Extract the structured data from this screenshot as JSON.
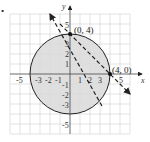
{
  "figure": {
    "bullet": "•",
    "axes": {
      "x_label": "x",
      "y_label": "y",
      "x_ticks": [
        "-5",
        "-3",
        "-2",
        "-1",
        "1",
        "2",
        "3",
        "5"
      ],
      "y_ticks": [
        "5",
        "3",
        "2",
        "1",
        "-1",
        "-2",
        "-3",
        "-5"
      ]
    },
    "points": [
      {
        "label": "(0, 4)",
        "x": 0,
        "y": 4
      },
      {
        "label": "(4, 0)",
        "x": 4,
        "y": 0
      }
    ],
    "circle": {
      "center": [
        0,
        0
      ],
      "radius": 4,
      "shaded": true,
      "style": "solid"
    },
    "line": {
      "through": [
        [
          0,
          4
        ],
        [
          4,
          0
        ]
      ],
      "style": "dashed",
      "arrows": "both"
    },
    "colors": {
      "shade": "#d9d9d9",
      "grid": "#cfcfcf",
      "ink": "#222222"
    }
  }
}
